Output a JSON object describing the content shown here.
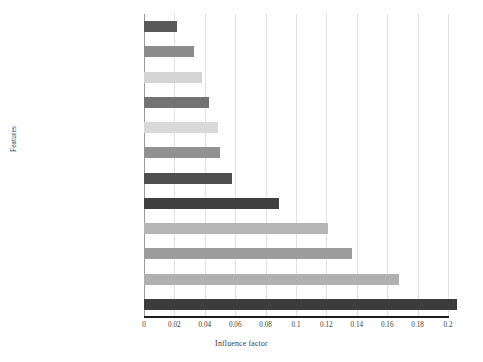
{
  "chart_data": {
    "type": "bar",
    "orientation": "horizontal",
    "title": "",
    "xlabel": "Influence factor",
    "ylabel": "Features",
    "xlim": [
      0,
      0.2
    ],
    "xticks": [
      "0",
      "0.02",
      "0.04",
      "0.06",
      "0.08",
      "0.1",
      "0.12",
      "0.14",
      "0.16",
      "0.18",
      "0.2"
    ],
    "xtick_values": [
      0,
      0.02,
      0.04,
      0.06,
      0.08,
      0.1,
      0.12,
      0.14,
      0.16,
      0.18,
      0.2
    ],
    "grid": true,
    "legend": "none",
    "categories": [
      "Students",
      "Location of college entrance examination",
      "Direct contact",
      "Gender",
      "Place of birth",
      "Teachers",
      "Number of resource visits after class",
      "Students' course satisfaction",
      "Participation in course discussion",
      "Absence of students",
      "Course test scores",
      "Students' class activity"
    ],
    "values": [
      0.022,
      0.033,
      0.038,
      0.043,
      0.049,
      0.05,
      0.058,
      0.089,
      0.121,
      0.137,
      0.168,
      0.206
    ],
    "bar_colors": [
      "#595959",
      "#8c8c8c",
      "#d4d4d4",
      "#737373",
      "#d9d9d9",
      "#919191",
      "#4f4f4f",
      "#3f3f3f",
      "#b5b5b5",
      "#9c9c9c",
      "#b0b0b0",
      "#3c3c3c"
    ]
  },
  "axis": {
    "x_title": "Influence factor",
    "y_title": "Features"
  }
}
